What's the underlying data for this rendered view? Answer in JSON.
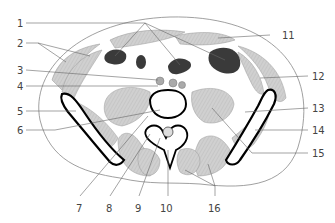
{
  "diagram": {
    "type": "anatomical cross-section (abdomen, lumbar level)",
    "labels": [
      {
        "id": "1",
        "text": "1",
        "x": 17,
        "y": 19
      },
      {
        "id": "2",
        "text": "2",
        "x": 17,
        "y": 39
      },
      {
        "id": "3",
        "text": "3",
        "x": 17,
        "y": 66
      },
      {
        "id": "4",
        "text": "4",
        "x": 17,
        "y": 82
      },
      {
        "id": "5",
        "text": "5",
        "x": 17,
        "y": 107
      },
      {
        "id": "6",
        "text": "6",
        "x": 17,
        "y": 126
      },
      {
        "id": "7",
        "text": "7",
        "x": 76,
        "y": 204
      },
      {
        "id": "8",
        "text": "8",
        "x": 106,
        "y": 204
      },
      {
        "id": "9",
        "text": "9",
        "x": 135,
        "y": 204
      },
      {
        "id": "10",
        "text": "10",
        "x": 160,
        "y": 204
      },
      {
        "id": "11",
        "text": "11",
        "x": 282,
        "y": 31
      },
      {
        "id": "12",
        "text": "12",
        "x": 312,
        "y": 72
      },
      {
        "id": "13",
        "text": "13",
        "x": 312,
        "y": 104
      },
      {
        "id": "14",
        "text": "14",
        "x": 312,
        "y": 126
      },
      {
        "id": "15",
        "text": "15",
        "x": 312,
        "y": 149
      },
      {
        "id": "16",
        "text": "16",
        "x": 208,
        "y": 204
      }
    ],
    "colors": {
      "muscle": "#c8c8c8",
      "organ_dark": "#3a3a3a",
      "bone_outline": "#000000",
      "outline": "#777777",
      "leader": "#666666",
      "label": "#444444"
    }
  }
}
